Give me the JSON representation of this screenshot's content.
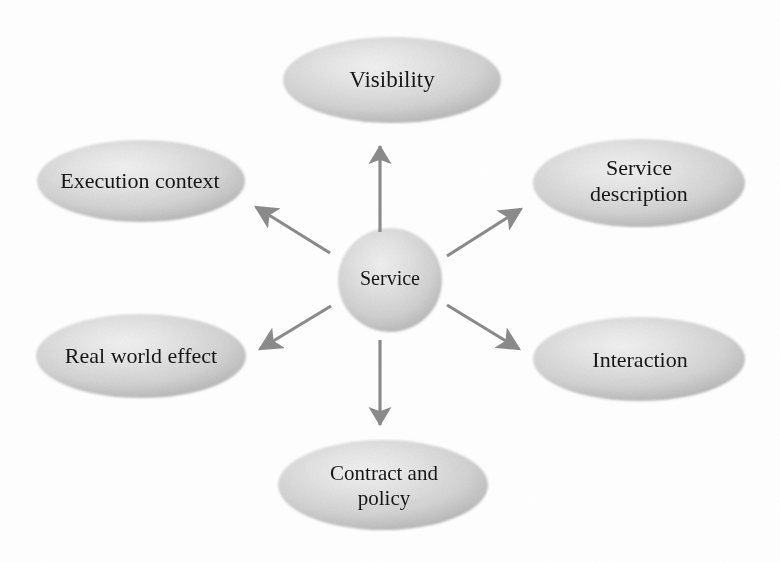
{
  "diagram": {
    "type": "hub-and-spoke",
    "background_color": "#fefefe",
    "node_fill_light": "#ededed",
    "node_fill_mid": "#d4d4d4",
    "node_fill_edge": "#a9a9a9",
    "arrow_color": "#8a8a8a",
    "text_color": "#151515",
    "center": {
      "id": "service",
      "label": "Service",
      "shape": "circle",
      "cx": 390,
      "cy": 280,
      "r": 52
    },
    "nodes": [
      {
        "id": "visibility",
        "label": "Visibility",
        "shape": "ellipse",
        "cx": 392,
        "cy": 80,
        "rx": 109,
        "ry": 43,
        "direction": "up"
      },
      {
        "id": "execution-context",
        "label": "Execution context",
        "shape": "ellipse",
        "cx": 141,
        "cy": 181,
        "rx": 104,
        "ry": 41,
        "direction": "up-left"
      },
      {
        "id": "service-description",
        "label": "Service\ndescription",
        "shape": "ellipse",
        "cx": 639,
        "cy": 183,
        "rx": 106,
        "ry": 44,
        "direction": "up-right"
      },
      {
        "id": "real-world-effect",
        "label": "Real world effect",
        "shape": "ellipse",
        "cx": 141,
        "cy": 356,
        "rx": 105,
        "ry": 42,
        "direction": "down-left"
      },
      {
        "id": "interaction",
        "label": "Interaction",
        "shape": "ellipse",
        "cx": 639,
        "cy": 359,
        "rx": 106,
        "ry": 42,
        "direction": "down-right"
      },
      {
        "id": "contract-and-policy",
        "label": "Contract and\npolicy",
        "shape": "ellipse",
        "cx": 383,
        "cy": 485,
        "rx": 105,
        "ry": 45,
        "direction": "down"
      }
    ],
    "arrows": [
      {
        "id": "arrow-to-visibility",
        "from": "service",
        "to": "visibility",
        "x1": 380,
        "y1": 232,
        "x2": 380,
        "y2": 142
      },
      {
        "id": "arrow-to-execution-context",
        "from": "service",
        "to": "execution-context",
        "x1": 330,
        "y1": 253,
        "x2": 252,
        "y2": 204
      },
      {
        "id": "arrow-to-service-description",
        "from": "service",
        "to": "service-description",
        "x1": 447,
        "y1": 256,
        "x2": 525,
        "y2": 206
      },
      {
        "id": "arrow-to-real-world-effect",
        "from": "service",
        "to": "real-world-effect",
        "x1": 331,
        "y1": 306,
        "x2": 256,
        "y2": 352
      },
      {
        "id": "arrow-to-interaction",
        "from": "service",
        "to": "interaction",
        "x1": 447,
        "y1": 305,
        "x2": 523,
        "y2": 352
      },
      {
        "id": "arrow-to-contract-and-policy",
        "from": "service",
        "to": "contract-and-policy",
        "x1": 380,
        "y1": 340,
        "x2": 380,
        "y2": 432
      }
    ]
  }
}
